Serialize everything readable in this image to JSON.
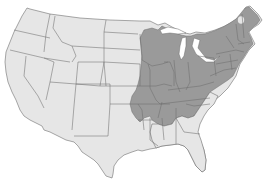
{
  "map": {
    "title": "",
    "region": "Contiguous United States",
    "projection": "conic",
    "colors": {
      "background": "#ffffff",
      "land": "#e6e6e6",
      "range": "#9a9a9a",
      "border": "#6e6e6e"
    },
    "layers": [
      {
        "name": "base-states",
        "description": "All 48 contiguous states in light gray"
      },
      {
        "name": "shaded-range",
        "description": "Darker gray range covering Midwest, Northeast, Mid-Atlantic and interior Southeast"
      }
    ],
    "shaded_area_states": [
      "Minnesota (east)",
      "Wisconsin",
      "Michigan",
      "Iowa",
      "Missouri",
      "Illinois",
      "Indiana",
      "Ohio",
      "Kentucky",
      "Tennessee",
      "Arkansas (north)",
      "Mississippi (north)",
      "Alabama",
      "Georgia (north)",
      "West Virginia",
      "Virginia",
      "North Carolina (west)",
      "Pennsylvania",
      "New York",
      "Vermont",
      "New Hampshire",
      "Maine",
      "Massachusetts",
      "Connecticut",
      "Rhode Island",
      "New Jersey",
      "Delaware",
      "Maryland",
      "Kansas (east)",
      "Nebraska (east)",
      "Oklahoma (east)",
      "South Dakota (east)"
    ],
    "unshaded_notes": [
      "Adirondack spot in northern New York",
      "Coastal plain of the Southeast",
      "Florida",
      "Louisiana",
      "Western states"
    ]
  }
}
